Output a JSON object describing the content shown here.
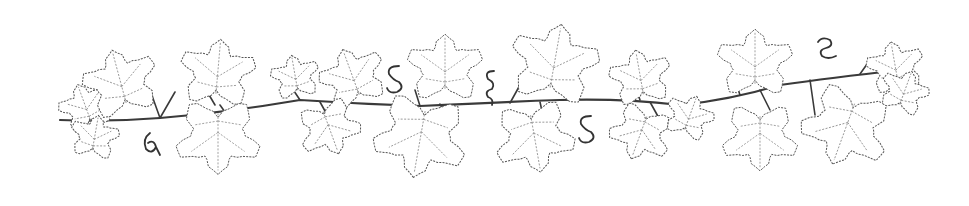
{
  "illustration": {
    "subject": "decorative grapevine border",
    "style": "dotted line-art",
    "colors": {
      "background": "#ffffff",
      "ink": "#3a3a3a"
    },
    "leaves": [
      {
        "cx": 85,
        "cy": 105,
        "r": 24,
        "rot": -20
      },
      {
        "cx": 120,
        "cy": 80,
        "r": 34,
        "rot": -15
      },
      {
        "cx": 95,
        "cy": 135,
        "r": 22,
        "rot": 10
      },
      {
        "cx": 218,
        "cy": 70,
        "r": 34,
        "rot": 5
      },
      {
        "cx": 218,
        "cy": 140,
        "r": 38,
        "rot": 180
      },
      {
        "cx": 295,
        "cy": 75,
        "r": 22,
        "rot": -10
      },
      {
        "cx": 352,
        "cy": 75,
        "r": 30,
        "rot": -20
      },
      {
        "cx": 330,
        "cy": 130,
        "r": 28,
        "rot": 160
      },
      {
        "cx": 445,
        "cy": 65,
        "r": 34,
        "rot": 0
      },
      {
        "cx": 420,
        "cy": 140,
        "r": 42,
        "rot": 190
      },
      {
        "cx": 555,
        "cy": 60,
        "r": 40,
        "rot": 10
      },
      {
        "cx": 535,
        "cy": 140,
        "r": 36,
        "rot": 170
      },
      {
        "cx": 640,
        "cy": 75,
        "r": 28,
        "rot": -10
      },
      {
        "cx": 640,
        "cy": 135,
        "r": 28,
        "rot": 200
      },
      {
        "cx": 690,
        "cy": 115,
        "r": 22,
        "rot": 20
      },
      {
        "cx": 755,
        "cy": 60,
        "r": 34,
        "rot": 0
      },
      {
        "cx": 760,
        "cy": 140,
        "r": 34,
        "rot": 180
      },
      {
        "cx": 845,
        "cy": 130,
        "r": 40,
        "rot": 200
      },
      {
        "cx": 895,
        "cy": 65,
        "r": 26,
        "rot": -10
      },
      {
        "cx": 905,
        "cy": 90,
        "r": 22,
        "rot": 20
      }
    ],
    "tendrils": [
      {
        "x": 150,
        "y": 145,
        "shape": "a"
      },
      {
        "x": 393,
        "y": 80,
        "shape": "S"
      },
      {
        "x": 490,
        "y": 85,
        "shape": "g"
      },
      {
        "x": 585,
        "y": 130,
        "shape": "S"
      },
      {
        "x": 826,
        "y": 50,
        "shape": "e"
      }
    ]
  }
}
